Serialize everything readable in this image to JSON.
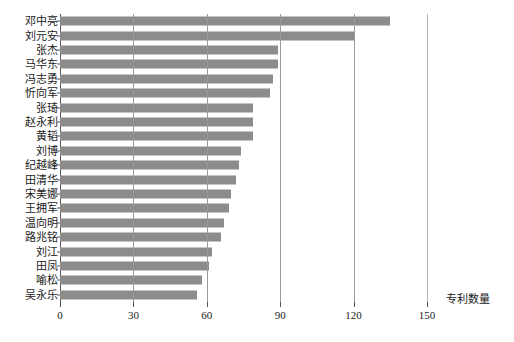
{
  "chart_data": {
    "type": "bar",
    "orientation": "horizontal",
    "title": "",
    "xlabel": "专利数量",
    "ylabel": "",
    "xlim": [
      0,
      150
    ],
    "ylim": null,
    "grid": true,
    "legend": null,
    "xticks": [
      0,
      30,
      60,
      90,
      120,
      150
    ],
    "xtick_labels": [
      "0",
      "30",
      "60",
      "90",
      "120",
      "150"
    ],
    "bar_color": "#8c8c8c",
    "categories": [
      "邓中亮",
      "刘元安",
      "张杰",
      "马华东",
      "冯志勇",
      "忻向军",
      "张琦",
      "赵永利",
      "黄韬",
      "刘博",
      "纪越峰",
      "田清华",
      "宋美娜",
      "王拥军",
      "温向明",
      "路兆铭",
      "刘江",
      "田凤",
      "喻松",
      "吴永乐"
    ],
    "values": [
      135,
      120,
      89,
      89,
      87,
      86,
      79,
      79,
      79,
      74,
      73,
      72,
      70,
      69,
      67,
      66,
      62,
      61,
      58,
      56
    ]
  }
}
